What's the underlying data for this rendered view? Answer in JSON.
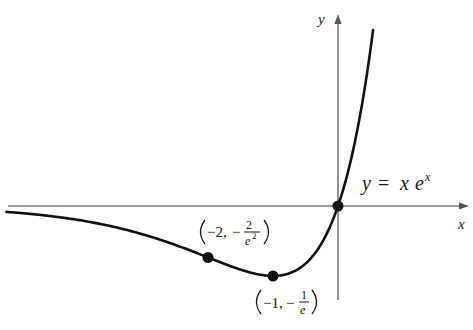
{
  "figure": {
    "function_label": {
      "y": "y",
      "eq": "=",
      "x": "x",
      "e": "e",
      "exp": "x"
    },
    "axes": {
      "x_label": "x",
      "y_label": "y"
    },
    "points": [
      {
        "name": "origin",
        "x": 0,
        "y": 0
      },
      {
        "name": "point-minus-two",
        "x": -2,
        "y": -0.2707,
        "label_x": "−2,",
        "label_num": "2",
        "label_den_base": "e",
        "label_den_exp": "2",
        "label_sign": "−"
      },
      {
        "name": "minimum-point",
        "x": -1,
        "y": -0.3679,
        "label_x": "−1,",
        "label_num": "1",
        "label_den_base": "e",
        "label_sign": "−"
      }
    ],
    "colors": {
      "curve": "#111111",
      "axis": "#7a7a7a",
      "background": "#ffffff"
    }
  },
  "chart_data": {
    "type": "line",
    "xlabel": "x",
    "ylabel": "y",
    "grid": false,
    "xlim": [
      -5.1,
      2.0
    ],
    "ylim": [
      -0.65,
      1.1
    ],
    "series": [
      {
        "name": "y = x e^x",
        "x": [
          -5.1,
          -4.5,
          -4,
          -3.5,
          -3,
          -2.5,
          -2,
          -1.5,
          -1,
          -0.5,
          0,
          0.25,
          0.5,
          0.55
        ],
        "values": [
          -0.031,
          -0.05,
          -0.073,
          -0.106,
          -0.149,
          -0.205,
          -0.271,
          -0.335,
          -0.368,
          -0.303,
          0,
          0.321,
          0.824,
          0.953
        ]
      }
    ],
    "annotations": [
      {
        "x": -2,
        "y": -0.271,
        "text": "(−2, −2/e²)"
      },
      {
        "x": -1,
        "y": -0.368,
        "text": "(−1, −1/e)"
      },
      {
        "x": 0,
        "y": 0,
        "text": "origin"
      }
    ]
  }
}
